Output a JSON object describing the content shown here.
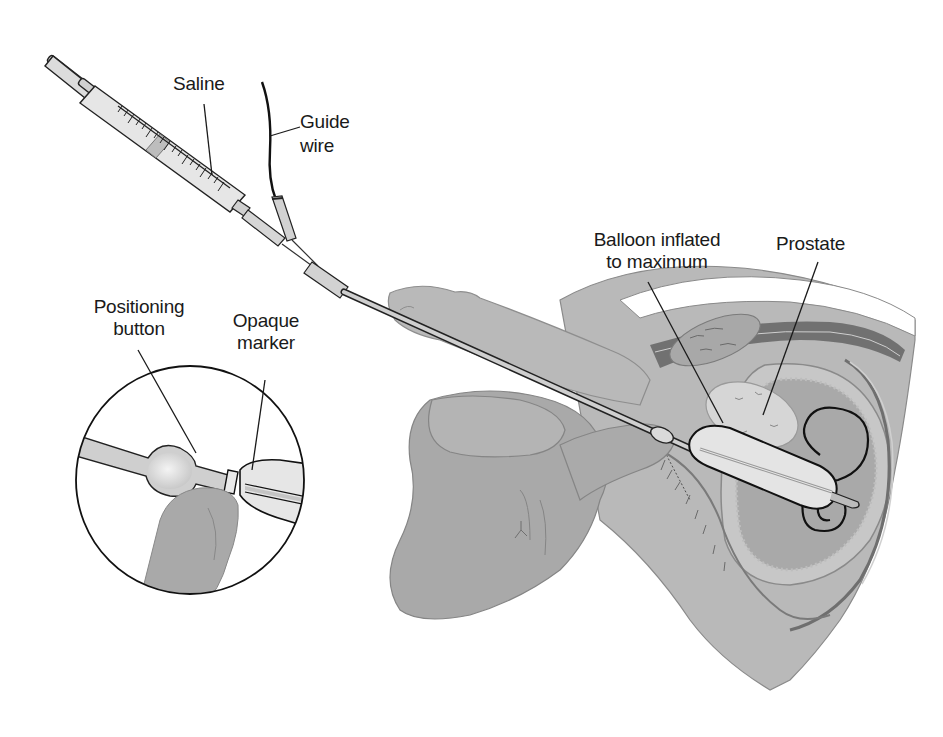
{
  "figure": {
    "colors": {
      "background": "#ffffff",
      "outline": "#1a1a1a",
      "tissue": "#b4b4b4",
      "tissue_dark": "#9c9c9c",
      "device_light": "#e4e4e4",
      "device_mid": "#cfcfcf",
      "ghost_text": "#e8e8e8"
    },
    "labels": {
      "saline": "Saline",
      "guide_wire_line1": "Guide",
      "guide_wire_line2": "wire",
      "balloon_line1": "Balloon inflated",
      "balloon_line2": "to maximum",
      "prostate": "Prostate",
      "positioning_line1": "Positioning",
      "positioning_line2": "button",
      "opaque_line1": "Opaque",
      "opaque_line2": "marker"
    },
    "components": [
      "syringe",
      "guide-wire",
      "catheter",
      "balloon",
      "positioning-button",
      "opaque-marker",
      "inset-magnifier",
      "penis",
      "hand",
      "prostate",
      "bladder",
      "rectum",
      "pubic-bone"
    ]
  }
}
